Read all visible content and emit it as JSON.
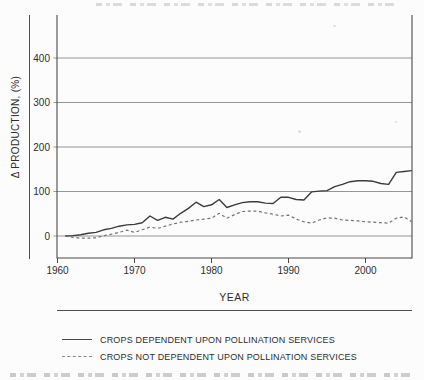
{
  "figure": {
    "background": "#fcfcfc",
    "ink_color": "#3c3c3c",
    "grid_color": "#8a8a8a",
    "spine_color": "#4a4a4a",
    "dashed_line_color": "#747474",
    "text_color": "#2e2e2e"
  },
  "chart_data": {
    "type": "line",
    "title": "",
    "xlabel": "YEAR",
    "ylabel": "Δ PRODUCTION, (%)",
    "xlim": [
      1960,
      2006
    ],
    "ylim": [
      -50,
      500
    ],
    "x_ticks": [
      1960,
      1970,
      1980,
      1990,
      2000
    ],
    "y_ticks": [
      0,
      100,
      200,
      300,
      400
    ],
    "grid": true,
    "legend_position": "below-chart",
    "x": [
      1961,
      1962,
      1963,
      1964,
      1965,
      1966,
      1967,
      1968,
      1969,
      1970,
      1971,
      1972,
      1973,
      1974,
      1975,
      1976,
      1977,
      1978,
      1979,
      1980,
      1981,
      1982,
      1983,
      1984,
      1985,
      1986,
      1987,
      1988,
      1989,
      1990,
      1991,
      1992,
      1993,
      1994,
      1995,
      1996,
      1997,
      1998,
      1999,
      2000,
      2001,
      2002,
      2003,
      2004,
      2005,
      2006
    ],
    "series": [
      {
        "name": "CROPS DEPENDENT UPON POLLINATION SERVICES",
        "line_style": "solid",
        "values": [
          0,
          1,
          3,
          6,
          8,
          14,
          17,
          22,
          25,
          26,
          30,
          45,
          35,
          42,
          38,
          51,
          62,
          76,
          66,
          70,
          82,
          64,
          70,
          75,
          77,
          77,
          74,
          73,
          87,
          87,
          82,
          81,
          99,
          101,
          102,
          111,
          116,
          122,
          124,
          124,
          123,
          118,
          116,
          143,
          145,
          147
        ]
      },
      {
        "name": "CROPS NOT DEPENDENT UPON POLLINATION SERVICES",
        "line_style": "dashed",
        "values": [
          0,
          -3,
          -5,
          -5,
          -4,
          1,
          4,
          8,
          13,
          8,
          14,
          20,
          17,
          22,
          27,
          31,
          33,
          36,
          38,
          40,
          51,
          40,
          48,
          55,
          56,
          56,
          52,
          49,
          45,
          47,
          38,
          32,
          29,
          36,
          41,
          40,
          36,
          35,
          34,
          32,
          31,
          30,
          29,
          40,
          43,
          32
        ]
      }
    ]
  }
}
